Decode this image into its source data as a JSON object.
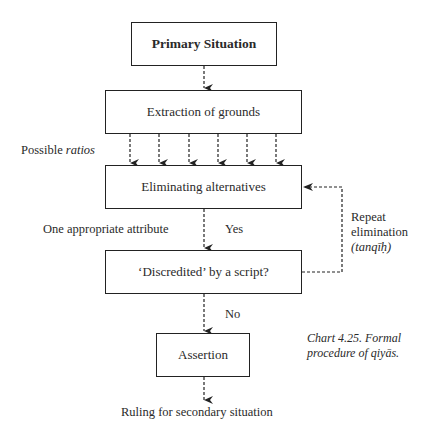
{
  "diagram": {
    "nodes": {
      "primary": "Primary Situation",
      "extraction": "Extraction of grounds",
      "eliminating": "Eliminating alternatives",
      "discredited": "‘Discredited’ by a script?",
      "assertion": "Assertion"
    },
    "labels": {
      "possible": "Possible",
      "ratios": "ratios",
      "one_attribute": "One appropriate attribute",
      "yes": "Yes",
      "no": "No",
      "repeat_1": "Repeat",
      "repeat_2": "elimination",
      "tanqih": "(tanqīḥ)",
      "ruling": "Ruling for secondary situation"
    },
    "caption": {
      "line1_prefix": "Chart 4.25.",
      "line1_suffix": "Formal",
      "line2": "procedure of qiyās."
    },
    "colors": {
      "line": "#222222",
      "text": "#2a2a2a",
      "background": "#ffffff"
    }
  }
}
